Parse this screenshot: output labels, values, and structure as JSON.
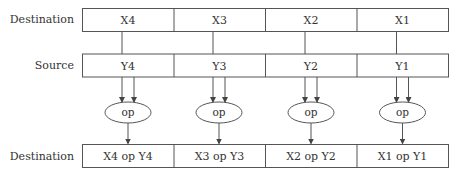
{
  "rows": {
    "destination_top": {
      "label": "Destination",
      "cells": [
        "X4",
        "X3",
        "X2",
        "X1"
      ]
    },
    "source": {
      "label": "Source",
      "cells": [
        "Y4",
        "Y3",
        "Y2",
        "Y1"
      ]
    },
    "operations": [
      "op",
      "op",
      "op",
      "op"
    ],
    "destination_bottom": {
      "label": "Destination",
      "cells": [
        "X4 op Y4",
        "X3 op Y3",
        "X2 op Y2",
        "X1 op Y1"
      ]
    }
  },
  "colors": {
    "stroke": "#555555",
    "text": "#333333",
    "background": "#ffffff"
  }
}
